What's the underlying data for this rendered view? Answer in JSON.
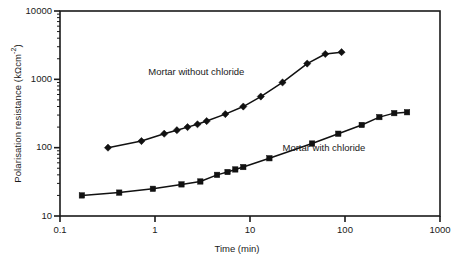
{
  "figure": {
    "background": "#ffffff",
    "frame_color": "#1a1a1a"
  },
  "axes": {
    "x": {
      "label_prefix": "Time",
      "label_unit": "(min)",
      "label": "Time (min)",
      "scale": "log",
      "min": 0.1,
      "max": 1000,
      "ticks": [
        "0.1",
        "1",
        "10",
        "100",
        "1000"
      ],
      "tick_values": [
        0.1,
        1,
        10,
        100,
        1000
      ]
    },
    "y": {
      "label_main": "Polarisation resistance (kΩcm",
      "label_sup": "-2",
      "label_tail": ")",
      "label": "Polarisation resistance (kΩcm⁻²)",
      "scale": "log",
      "min": 10,
      "max": 10000,
      "ticks": [
        "10",
        "100",
        "1000",
        "10000"
      ],
      "tick_values": [
        10,
        100,
        1000,
        10000
      ]
    }
  },
  "annotations": [
    {
      "text": "Mortar without chloride",
      "x": 0.85,
      "y": 1250
    },
    {
      "text": "Mortar with chloride",
      "x": 22,
      "y": 95
    }
  ],
  "chart_data": {
    "type": "line",
    "title": "",
    "xlabel": "Time (min)",
    "ylabel": "Polarisation resistance (kΩcm⁻²)",
    "xscale": "log",
    "yscale": "log",
    "xlim": [
      0.1,
      1000
    ],
    "ylim": [
      10,
      10000
    ],
    "grid": false,
    "legend": "none (curves labelled inline)",
    "series": [
      {
        "name": "Mortar without chloride",
        "marker": "diamond",
        "color": "#111111",
        "x": [
          0.32,
          0.72,
          1.25,
          1.7,
          2.2,
          2.8,
          3.5,
          5.5,
          8.5,
          13,
          22,
          40,
          62,
          92
        ],
        "y": [
          100,
          125,
          160,
          180,
          200,
          220,
          245,
          310,
          400,
          560,
          900,
          1700,
          2350,
          2500
        ]
      },
      {
        "name": "Mortar with chloride",
        "marker": "square",
        "color": "#111111",
        "x": [
          0.17,
          0.42,
          0.95,
          1.9,
          3.0,
          4.5,
          5.8,
          7.0,
          8.5,
          16,
          45,
          85,
          150,
          230,
          330,
          450
        ],
        "y": [
          20,
          22,
          25,
          29,
          32,
          40,
          44,
          48,
          52,
          70,
          115,
          160,
          215,
          280,
          320,
          330
        ]
      }
    ]
  }
}
